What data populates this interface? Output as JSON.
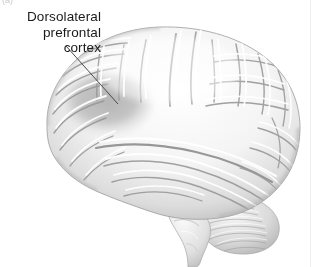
{
  "figure": {
    "panel_label": "(a)",
    "background_color": "#ffffff",
    "width": 318,
    "height": 267
  },
  "annotation": {
    "label_lines": [
      "Dorsolateral",
      "prefrontal",
      "cortex"
    ],
    "label_full": "Dorsolateral prefrontal cortex",
    "text_color": "#1a1a1a",
    "leader_line": {
      "color": "#4a4a4a",
      "x1": 66,
      "y1": 46,
      "x2": 118,
      "y2": 104
    }
  },
  "highlight": {
    "name": "dorsolateral-prefrontal-cortex-shading",
    "fill_color": "#b5b5b5",
    "center_x": 108,
    "center_y": 104,
    "radius_x": 42,
    "radius_y": 30
  },
  "anatomy": {
    "regions": [
      "cerebral-cortex",
      "frontal-lobe",
      "parietal-lobe",
      "temporal-lobe",
      "occipital-lobe",
      "cerebellum",
      "brainstem"
    ],
    "orientation": "left-facing lateral view",
    "palette": {
      "outline": "#9a9a9a",
      "surface_light": "#fdfdfd",
      "surface_mid": "#e2e2e2",
      "surface_shadow": "#b0b0b0",
      "sulcus_dark": "#8e8e8e"
    }
  },
  "divider": {
    "name": "right-edge-rule",
    "color": "#ededed"
  }
}
